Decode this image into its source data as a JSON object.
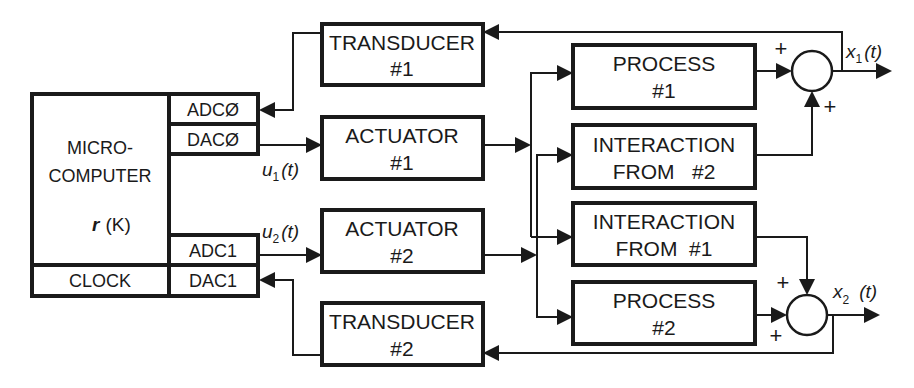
{
  "microcomputer": {
    "title_line1": "MICRO-",
    "title_line2": "COMPUTER",
    "function_var": "r",
    "function_arg": "(K)",
    "ports": {
      "adc0": "ADCØ",
      "dac0": "DACØ",
      "adc1": "ADC1",
      "dac1": "DAC1"
    },
    "clock": "CLOCK"
  },
  "blocks": {
    "transducer1": {
      "line1": "TRANSDUCER",
      "line2": "#1"
    },
    "actuator1": {
      "line1": "ACTUATOR",
      "line2": "#1"
    },
    "actuator2": {
      "line1": "ACTUATOR",
      "line2": "#2"
    },
    "transducer2": {
      "line1": "TRANSDUCER",
      "line2": "#2"
    },
    "process1": {
      "line1": "PROCESS",
      "line2": "#1"
    },
    "interaction_from2": {
      "line1": "INTERACTION",
      "line2": "FROM   #2"
    },
    "interaction_from1": {
      "line1": "INTERACTION",
      "line2": "FROM  #1"
    },
    "process2": {
      "line1": "PROCESS",
      "line2": "#2"
    }
  },
  "signals": {
    "u1": {
      "var": "u",
      "sub": "1",
      "arg": "(t)"
    },
    "u2": {
      "var": "u",
      "sub": "2",
      "arg": "(t)"
    },
    "x1": {
      "var": "x",
      "sub": "1",
      "arg": "(t)"
    },
    "x2": {
      "var": "x",
      "sub": "2",
      "arg": "(t)"
    }
  },
  "summing_junctions": {
    "sum1": {
      "sign_left": "+",
      "sign_bottom": "+"
    },
    "sum2": {
      "sign_top": "+",
      "sign_left": "+"
    }
  }
}
